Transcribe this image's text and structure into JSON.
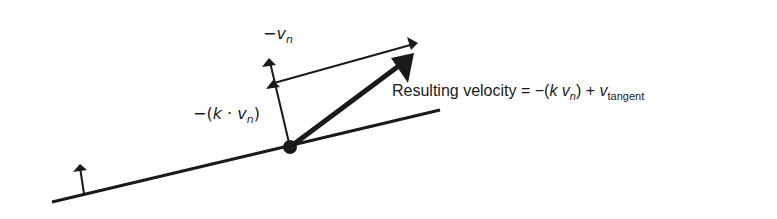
{
  "diagram": {
    "labels": {
      "neg_vn": {
        "prefix": "−",
        "var": "v",
        "sub": "n"
      },
      "scaled_normal": {
        "open": "−(",
        "k": "k",
        "dot": " · ",
        "var": "v",
        "sub": "n",
        "close": ")"
      },
      "result": {
        "text": "Resulting velocity = −(",
        "k": "k",
        "var": "v",
        "sub_n": "n",
        "mid": ") + ",
        "var2": "v",
        "sub_t": "tangent"
      }
    },
    "colors": {
      "ink": "#1a1a1a",
      "background": "#ffffff"
    }
  }
}
